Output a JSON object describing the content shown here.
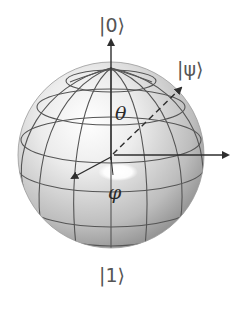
{
  "diagram": {
    "labels": {
      "north_pole": "|0⟩",
      "south_pole": "|1⟩",
      "state": "|ψ⟩",
      "polar_angle": "θ",
      "azimuthal_angle": "φ"
    },
    "colors": {
      "background": "#ffffff",
      "sphere_light": "#fafafa",
      "sphere_dark": "#8c8c8c",
      "grid_lines": "#555555",
      "axes": "#2e2e2e",
      "text": "#555555"
    },
    "elements": [
      {
        "name": "sphere",
        "kind": "shaded sphere with latitude/longitude grid"
      },
      {
        "name": "z-axis",
        "kind": "solid arrow",
        "direction": "up",
        "points_to": "|0⟩"
      },
      {
        "name": "x-axis",
        "kind": "solid arrow",
        "direction": "lower-left (toward viewer)"
      },
      {
        "name": "y-axis",
        "kind": "solid arrow",
        "direction": "right"
      },
      {
        "name": "state-vector",
        "kind": "dashed arrow",
        "direction": "upper-right",
        "points_to": "|ψ⟩"
      },
      {
        "name": "theta",
        "kind": "angle label",
        "between": "z-axis and state-vector"
      },
      {
        "name": "phi",
        "kind": "angle label",
        "between": "x-axis and projection of state-vector"
      }
    ]
  }
}
